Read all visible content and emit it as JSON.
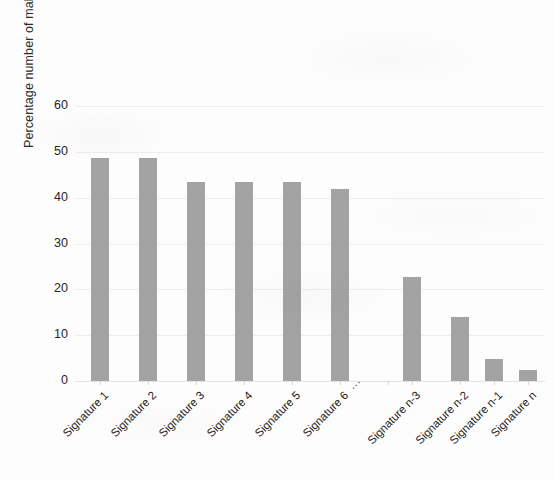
{
  "chart_data": {
    "type": "bar",
    "title": "",
    "subtitle": "",
    "xlabel": "",
    "ylabel": "Percentage number of malwares (%)",
    "categories": [
      "Signature 1",
      "Signature 2",
      "Signature 3",
      "Signature 4",
      "Signature 5",
      "Signature 6",
      "...",
      "Signature n-3",
      "Signature n-2",
      "Signature n-1",
      "Signature n"
    ],
    "values": [
      48.6,
      48.6,
      43.4,
      43.4,
      43.4,
      41.9,
      null,
      22.8,
      14.0,
      4.9,
      2.4
    ],
    "ylim": [
      0,
      60
    ],
    "yticks": [
      0,
      10,
      20,
      30,
      40,
      50,
      60
    ],
    "ytick_labels": [
      "0",
      "10",
      "20",
      "30",
      "40",
      "50",
      "60"
    ],
    "grid": true,
    "legend": false,
    "legend_position": "none",
    "bar_color": "#a3a3a3",
    "gridline_color": "#ededed",
    "axis_text_color": "#262626",
    "background_color": "#fdfdfd",
    "gap_marker": "...",
    "gap_index": 6,
    "annotations": []
  }
}
